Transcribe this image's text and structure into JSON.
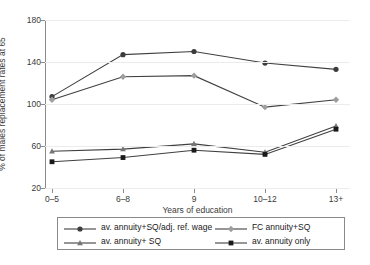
{
  "chart_data": {
    "type": "line",
    "title": "",
    "subtitle": "",
    "xlabel": "Years of education",
    "ylabel": "% of males replacement rates at 65",
    "categories": [
      "0–5",
      "6–8",
      "9",
      "10–12",
      "13+"
    ],
    "yticks": [
      20,
      60,
      100,
      140,
      180
    ],
    "ylim": [
      20,
      180
    ],
    "grid": "horizontal",
    "legend_position": "bottom",
    "series": [
      {
        "name": "av. annuity+SQ/adj. ref. wage",
        "marker": "circle",
        "color": "#3c3c3c",
        "values": [
          107,
          147,
          150,
          139,
          133
        ]
      },
      {
        "name": "FC annuity+SQ",
        "marker": "diamond",
        "color": "#9e9e9e",
        "values": [
          104,
          126,
          127,
          97,
          104
        ]
      },
      {
        "name": "av. annuity+ SQ",
        "marker": "triangle",
        "color": "#767676",
        "values": [
          55,
          57,
          62,
          54,
          79
        ]
      },
      {
        "name": "av. annuity only",
        "marker": "square",
        "color": "#1a1a1a",
        "values": [
          45,
          49,
          56,
          52,
          76
        ]
      }
    ]
  },
  "legend": {
    "entries": [
      {
        "label": "av. annuity+SQ/adj. ref. wage"
      },
      {
        "label": "FC annuity+SQ"
      },
      {
        "label": "av. annuity+ SQ"
      },
      {
        "label": "av. annuity only"
      }
    ]
  },
  "colors": {
    "axis": "#8a8a8a",
    "grid": "#ececec",
    "text": "#3a3a3a",
    "background": "#ffffff"
  }
}
